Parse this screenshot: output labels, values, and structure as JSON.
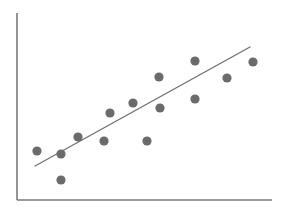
{
  "figure": {
    "width": 282,
    "height": 212,
    "background": "#ffffff"
  },
  "chart_data": {
    "type": "scatter",
    "title": "",
    "subtitle": "",
    "xlabel": "",
    "ylabel": "",
    "grid": false,
    "legend": null,
    "legend_position": "none",
    "axis_ticks": [],
    "xlim": [
      0,
      100
    ],
    "ylim": [
      0,
      100
    ],
    "annotations": [],
    "series": [
      {
        "name": "observations",
        "marker": "circle",
        "marker_color": "#6b6b6b",
        "marker_radius_px": 4.6,
        "x": [
          8,
          18,
          18,
          25,
          35,
          38,
          47,
          52,
          57,
          57,
          71,
          71,
          83,
          94
        ],
        "y": [
          26,
          24,
          10,
          33,
          31,
          46,
          51,
          31,
          65,
          48,
          73,
          53,
          64,
          73
        ],
        "points_px": [
          {
            "cx": 37,
            "cy": 151
          },
          {
            "cx": 61,
            "cy": 154
          },
          {
            "cx": 61,
            "cy": 180
          },
          {
            "cx": 78,
            "cy": 137
          },
          {
            "cx": 104,
            "cy": 141
          },
          {
            "cx": 110,
            "cy": 113
          },
          {
            "cx": 133,
            "cy": 103
          },
          {
            "cx": 147,
            "cy": 141
          },
          {
            "cx": 159,
            "cy": 77
          },
          {
            "cx": 160,
            "cy": 108
          },
          {
            "cx": 195,
            "cy": 61
          },
          {
            "cx": 195,
            "cy": 99
          },
          {
            "cx": 227,
            "cy": 78
          },
          {
            "cx": 253,
            "cy": 62
          }
        ]
      }
    ],
    "trendline": {
      "name": "linear fit",
      "color": "#6f6f6f",
      "width_px": 1.3,
      "x_px": [
        35,
        250
      ],
      "y_px": [
        166,
        47
      ]
    },
    "axes": {
      "color": "#7a7a7a",
      "width_px": 1.6,
      "x_axis_px": {
        "x1": 17,
        "y1": 200,
        "x2": 272,
        "y2": 200
      },
      "y_axis_px": {
        "x1": 17,
        "y1": 13,
        "x2": 17,
        "y2": 200
      },
      "tick_labels_x": [],
      "tick_labels_y": []
    }
  }
}
